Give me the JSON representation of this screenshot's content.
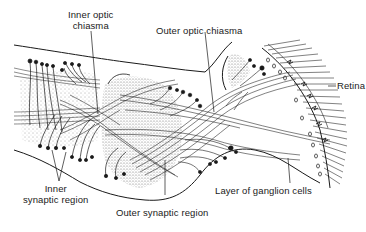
{
  "diagram": {
    "type": "anatomical-illustration",
    "labels": {
      "inner_optic_chiasma_line1": "Inner optic",
      "inner_optic_chiasma_line2": "chiasma",
      "outer_optic_chiasma": "Outer optic chiasma",
      "retina": "Retina",
      "inner_synaptic_region_line1": "Inner",
      "inner_synaptic_region_line2": "synaptic region",
      "outer_synaptic_region": "Outer synaptic region",
      "layer_of_ganglion_cells": "Layer of ganglion cells"
    },
    "colors": {
      "ink": "#1a1a1a",
      "background": "#ffffff"
    }
  }
}
